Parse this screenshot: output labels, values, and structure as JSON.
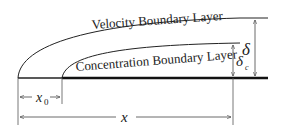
{
  "diagram": {
    "labels": {
      "velocity_layer": "Velocity Boundary Layer",
      "concentration_layer": "Concentration Boundary Layer",
      "delta": "δ",
      "delta_c": "δ",
      "delta_c_sub": "c",
      "x0": "x",
      "x0_sub": "0",
      "x": "x"
    },
    "colors": {
      "line": "#222222",
      "background": "#ffffff"
    }
  }
}
